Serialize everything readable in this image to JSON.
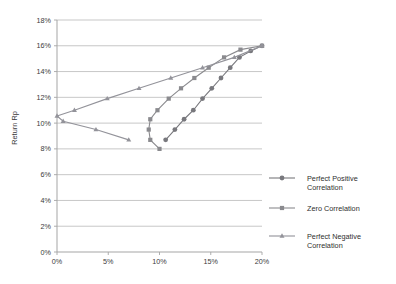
{
  "chart_data": {
    "type": "line",
    "title": "",
    "xlabel": "",
    "ylabel": "Return Rp",
    "xlim": [
      0,
      20
    ],
    "ylim": [
      0,
      18
    ],
    "grid": true,
    "legend_position": "right",
    "x_ticks": [
      "0%",
      "5%",
      "10%",
      "15%",
      "20%"
    ],
    "x_tick_values": [
      0,
      5,
      10,
      15,
      20
    ],
    "y_ticks": [
      "0%",
      "2%",
      "4%",
      "6%",
      "8%",
      "10%",
      "12%",
      "14%",
      "16%",
      "18%"
    ],
    "y_tick_values": [
      0,
      2,
      4,
      6,
      8,
      10,
      12,
      14,
      16,
      18
    ],
    "series": [
      {
        "name": "Perfect Positive Correlation",
        "marker": "circle",
        "color": "#78787d",
        "points": [
          [
            10.6,
            8.7
          ],
          [
            11.5,
            9.5
          ],
          [
            12.4,
            10.3
          ],
          [
            13.3,
            11.0
          ],
          [
            14.2,
            11.9
          ],
          [
            15.1,
            12.7
          ],
          [
            16.0,
            13.5
          ],
          [
            16.9,
            14.3
          ],
          [
            17.8,
            15.1
          ],
          [
            18.9,
            15.6
          ],
          [
            20.0,
            16.0
          ]
        ]
      },
      {
        "name": "Zero Correlation",
        "marker": "square",
        "color": "#8a8a8e",
        "points": [
          [
            10.0,
            8.0
          ],
          [
            9.1,
            8.7
          ],
          [
            8.95,
            9.5
          ],
          [
            9.1,
            10.3
          ],
          [
            9.8,
            11.0
          ],
          [
            10.9,
            11.9
          ],
          [
            12.1,
            12.7
          ],
          [
            13.4,
            13.5
          ],
          [
            14.8,
            14.3
          ],
          [
            16.3,
            15.1
          ],
          [
            17.9,
            15.7
          ],
          [
            20.0,
            16.0
          ]
        ]
      },
      {
        "name": "Perfect Negative Correlation",
        "marker": "triangle",
        "color": "#93939a",
        "points": [
          [
            0.0,
            10.55
          ],
          [
            0.6,
            10.15
          ],
          [
            3.8,
            9.5
          ],
          [
            7.0,
            8.7
          ],
          [
            0.0,
            10.55
          ],
          [
            1.7,
            11.0
          ],
          [
            4.9,
            11.9
          ],
          [
            8.0,
            12.7
          ],
          [
            11.1,
            13.5
          ],
          [
            14.2,
            14.3
          ],
          [
            17.3,
            15.1
          ],
          [
            20.0,
            16.0
          ]
        ]
      }
    ],
    "legend": [
      {
        "label_line1": "Perfect Positive",
        "label_line2": "Correlation",
        "marker": "circle",
        "color": "#78787d"
      },
      {
        "label_line1": "Zero Correlation",
        "label_line2": "",
        "marker": "square",
        "color": "#8a8a8e"
      },
      {
        "label_line1": "Perfect Negative",
        "label_line2": "Correlation",
        "marker": "triangle",
        "color": "#93939a"
      }
    ],
    "colors": {
      "background": "#ffffff",
      "gridline": "#b9b9b9",
      "axis": "#a5a5a5",
      "text": "#3a3a3a"
    }
  }
}
